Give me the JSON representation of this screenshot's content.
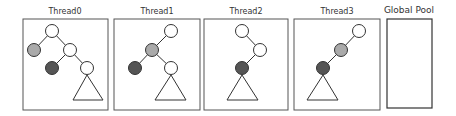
{
  "panels": [
    {
      "id": "thread0",
      "title": "Thread0"
    },
    {
      "id": "thread1",
      "title": "Thread1"
    },
    {
      "id": "thread2",
      "title": "Thread2"
    },
    {
      "id": "thread3",
      "title": "Thread3"
    },
    {
      "id": "global-pool",
      "title": "Global Pool"
    }
  ],
  "legend_colors": {
    "white_node": "#ffffff",
    "gray_node": "#aaaaaa",
    "dark_node": "#555555",
    "stroke": "#333333"
  }
}
